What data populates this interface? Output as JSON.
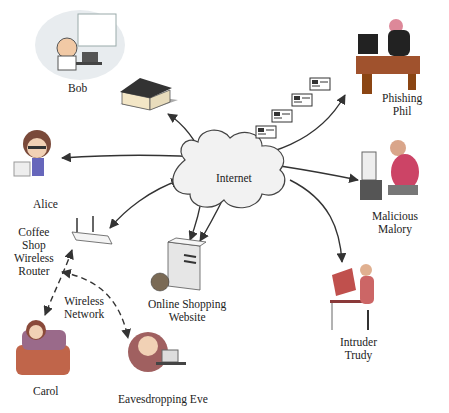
{
  "diagram": {
    "center": {
      "id": "internet",
      "label": "Internet",
      "shape": "cloud"
    },
    "nodes": [
      {
        "id": "bob",
        "label": "Bob",
        "icon": "person-at-desk-icon"
      },
      {
        "id": "bob-house",
        "label": "",
        "icon": "house-icon"
      },
      {
        "id": "phishing-phil",
        "label_lines": [
          "Phishing",
          "Phil"
        ],
        "icon": "hacker-at-computer-icon"
      },
      {
        "id": "alice",
        "label": "Alice",
        "icon": "person-with-laptop-icon"
      },
      {
        "id": "malicious-malory",
        "label_lines": [
          "Malicious",
          "Malory"
        ],
        "icon": "person-at-computer-icon"
      },
      {
        "id": "coffee-shop-router",
        "label_lines": [
          "Coffee",
          "Shop",
          "Wireless",
          "Router"
        ],
        "icon": "wireless-router-icon"
      },
      {
        "id": "online-shopping",
        "label_lines": [
          "Online Shopping",
          "Website"
        ],
        "icon": "server-globe-icon"
      },
      {
        "id": "intruder-trudy",
        "label_lines": [
          "Intruder",
          "Trudy"
        ],
        "icon": "person-at-desk-icon"
      },
      {
        "id": "carol",
        "label": "Carol",
        "icon": "person-in-armchair-icon"
      },
      {
        "id": "eavesdropping-eve",
        "label": "Eavesdropping Eve",
        "icon": "person-with-headset-icon"
      }
    ],
    "edges": [
      {
        "from": "internet",
        "to": "bob-house",
        "style": "solid",
        "arrow": "end"
      },
      {
        "from": "internet",
        "to": "phishing-phil",
        "style": "solid",
        "arrow": "end",
        "decoration": "email-envelopes"
      },
      {
        "from": "malicious-malory",
        "to": "alice",
        "style": "solid",
        "arrow": "both"
      },
      {
        "from": "internet",
        "to": "coffee-shop-router",
        "style": "solid",
        "arrow": "both"
      },
      {
        "from": "internet",
        "to": "online-shopping",
        "style": "solid",
        "arrow": "end",
        "count": 2
      },
      {
        "from": "internet",
        "to": "intruder-trudy",
        "style": "solid",
        "arrow": "end"
      },
      {
        "from": "coffee-shop-router",
        "to": "carol",
        "style": "dashed",
        "arrow": "both"
      },
      {
        "from": "coffee-shop-router",
        "to": "eavesdropping-eve",
        "style": "dashed",
        "arrow": "both"
      }
    ],
    "annotations": [
      {
        "id": "wireless-network",
        "label_lines": [
          "Wireless",
          "Network"
        ]
      }
    ],
    "email_envelope_count": 4,
    "colors": {
      "line": "#333333",
      "cloud_fill": "#f2f2f2",
      "cloud_stroke": "#444444",
      "text": "#222222"
    }
  }
}
